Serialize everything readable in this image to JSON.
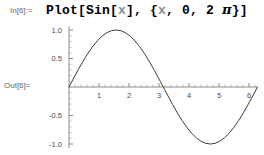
{
  "notebook": {
    "in_label": "In[6]:=",
    "out_label": "Out[6]=",
    "input_expression": {
      "full_text": "Plot[Sin[x], {x, 0, 2 π}]",
      "t1": "Plot[Sin[",
      "v1": "x",
      "t2": "], {",
      "v2": "x",
      "t3": ", 0, 2 ",
      "pi": "π",
      "t4": "}]"
    }
  },
  "chart_data": {
    "type": "line",
    "title": "",
    "xlabel": "",
    "ylabel": "",
    "expression": "Sin[x]",
    "xlim": [
      0,
      6.283185307179586
    ],
    "ylim": [
      -1,
      1
    ],
    "grid": false,
    "legend": null,
    "x_ticks": [
      {
        "value": 1,
        "label": "1"
      },
      {
        "value": 2,
        "label": "2"
      },
      {
        "value": 3,
        "label": "3"
      },
      {
        "value": 4,
        "label": "4"
      },
      {
        "value": 5,
        "label": "5"
      },
      {
        "value": 6,
        "label": "6"
      }
    ],
    "y_ticks": [
      {
        "value": 1.0,
        "label": "1.0"
      },
      {
        "value": 0.5,
        "label": "0.5"
      },
      {
        "value": -0.5,
        "label": "-0.5"
      },
      {
        "value": -1.0,
        "label": "-1.0"
      }
    ],
    "x_minor_step": 0.2,
    "y_minor_step": 0.1,
    "series": [
      {
        "name": "Sin[x]",
        "color": "#3d3d3d",
        "x": [
          0,
          0.157,
          0.314,
          0.471,
          0.628,
          0.785,
          0.942,
          1.099,
          1.257,
          1.414,
          1.571,
          1.728,
          1.885,
          2.042,
          2.199,
          2.356,
          2.513,
          2.67,
          2.827,
          2.985,
          3.142,
          3.299,
          3.456,
          3.613,
          3.77,
          3.927,
          4.084,
          4.241,
          4.398,
          4.555,
          4.712,
          4.869,
          5.027,
          5.184,
          5.341,
          5.498,
          5.655,
          5.812,
          5.969,
          6.126,
          6.283
        ],
        "y": [
          0.0,
          0.156,
          0.309,
          0.454,
          0.588,
          0.707,
          0.809,
          0.891,
          0.951,
          0.988,
          1.0,
          0.988,
          0.951,
          0.891,
          0.809,
          0.707,
          0.588,
          0.454,
          0.309,
          0.156,
          0.0,
          -0.156,
          -0.309,
          -0.454,
          -0.588,
          -0.707,
          -0.809,
          -0.891,
          -0.951,
          -0.988,
          -1.0,
          -0.988,
          -0.951,
          -0.891,
          -0.809,
          -0.707,
          -0.588,
          -0.454,
          -0.309,
          -0.156,
          0.0
        ]
      }
    ]
  },
  "colors": {
    "background": "#ffffff",
    "curve": "#3d3d3d",
    "axis": "#6e6e6e",
    "label_gray": "#5b6670",
    "text_black": "#000000",
    "symbol_gray": "#8a8a8a"
  }
}
